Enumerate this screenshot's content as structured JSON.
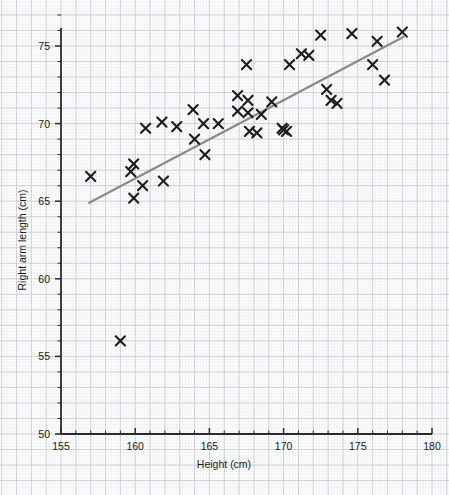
{
  "chart_data": {
    "type": "scatter",
    "title": "",
    "xlabel": "Height (cm)",
    "ylabel": "Right arm length (cm)",
    "xlim": [
      155,
      180
    ],
    "ylim": [
      50,
      77.2
    ],
    "x_major_ticks": [
      155,
      160,
      165,
      170,
      175,
      180
    ],
    "x_minor_tick_step": 1,
    "y_major_ticks": [
      50,
      55,
      60,
      65,
      70,
      75
    ],
    "y_minor_tick_step": 1,
    "x_tick_labels": [
      "155",
      "160",
      "165",
      "170",
      "175",
      "180"
    ],
    "y_tick_labels": [
      "50",
      "55",
      "60",
      "65",
      "70",
      "75"
    ],
    "grid": "graph-paper",
    "legend": "none",
    "marker": "x-cross",
    "marker_color": "#1c1c1c",
    "grid_major_color": "#c9cdd2",
    "grid_minor_color": "#e9ecef",
    "axis_color": "#2b2b2b",
    "trendline": {
      "show": true,
      "color": "#8a8a8a",
      "x_start": 156.9,
      "y_start": 64.9,
      "x_end": 178.1,
      "y_end": 75.6
    },
    "points": [
      {
        "x": 157.0,
        "y": 66.6
      },
      {
        "x": 159.0,
        "y": 56.0
      },
      {
        "x": 159.7,
        "y": 66.9
      },
      {
        "x": 159.9,
        "y": 67.4
      },
      {
        "x": 159.9,
        "y": 65.2
      },
      {
        "x": 160.5,
        "y": 66.0
      },
      {
        "x": 160.7,
        "y": 69.7
      },
      {
        "x": 161.8,
        "y": 70.1
      },
      {
        "x": 161.9,
        "y": 66.3
      },
      {
        "x": 162.8,
        "y": 69.8
      },
      {
        "x": 163.9,
        "y": 70.9
      },
      {
        "x": 164.0,
        "y": 69.0
      },
      {
        "x": 164.6,
        "y": 70.0
      },
      {
        "x": 164.7,
        "y": 68.0
      },
      {
        "x": 165.6,
        "y": 70.0
      },
      {
        "x": 166.9,
        "y": 71.8
      },
      {
        "x": 166.9,
        "y": 70.8
      },
      {
        "x": 167.5,
        "y": 73.8
      },
      {
        "x": 167.6,
        "y": 71.5
      },
      {
        "x": 167.6,
        "y": 70.7
      },
      {
        "x": 167.7,
        "y": 69.5
      },
      {
        "x": 168.2,
        "y": 69.4
      },
      {
        "x": 168.5,
        "y": 70.6
      },
      {
        "x": 169.2,
        "y": 71.4
      },
      {
        "x": 169.9,
        "y": 69.7
      },
      {
        "x": 170.0,
        "y": 69.6
      },
      {
        "x": 170.2,
        "y": 69.5
      },
      {
        "x": 170.4,
        "y": 73.8
      },
      {
        "x": 171.2,
        "y": 74.5
      },
      {
        "x": 171.7,
        "y": 74.4
      },
      {
        "x": 172.5,
        "y": 75.7
      },
      {
        "x": 172.9,
        "y": 72.2
      },
      {
        "x": 173.2,
        "y": 71.5
      },
      {
        "x": 173.6,
        "y": 71.3
      },
      {
        "x": 174.6,
        "y": 75.8
      },
      {
        "x": 176.0,
        "y": 73.8
      },
      {
        "x": 176.3,
        "y": 75.3
      },
      {
        "x": 176.8,
        "y": 72.8
      },
      {
        "x": 178.0,
        "y": 75.9
      }
    ]
  }
}
